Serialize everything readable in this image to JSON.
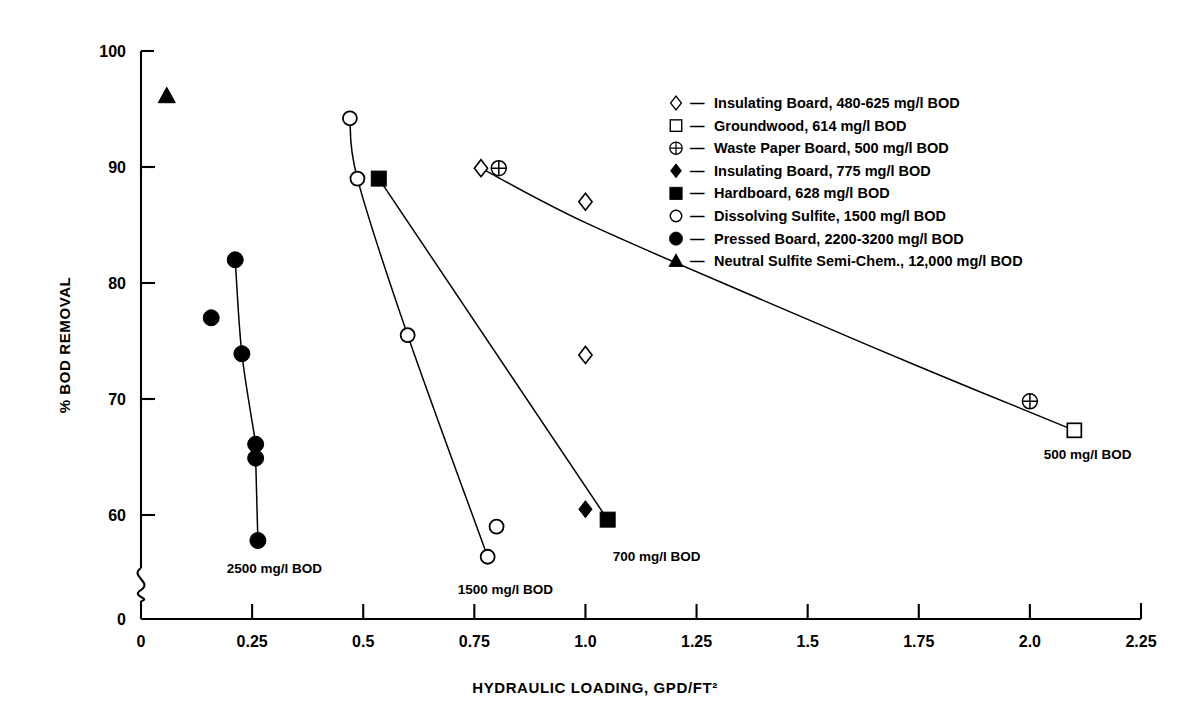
{
  "chart_data": {
    "type": "scatter",
    "title": "",
    "xlabel": "HYDRAULIC LOADING, GPD/FT²",
    "ylabel": "% BOD REMOVAL",
    "xlim": [
      0,
      2.25
    ],
    "ylim": [
      55,
      100
    ],
    "y_axis_break": true,
    "y_break_label": "0",
    "grid": false,
    "legend_position": "upper right",
    "xticks": [
      "0",
      "0.25",
      "0.5",
      "0.75",
      "1.0",
      "1.25",
      "1.5",
      "1.75",
      "2.0",
      "2.25"
    ],
    "xtick_values": [
      0,
      0.25,
      0.5,
      0.75,
      1.0,
      1.25,
      1.5,
      1.75,
      2.0,
      2.25
    ],
    "yticks": [
      "60",
      "70",
      "80",
      "90",
      "100"
    ],
    "ytick_values": [
      60,
      70,
      80,
      90,
      100
    ],
    "series": [
      {
        "name": "Insulating Board, 480-625 mg/l BOD",
        "marker": "open-diamond",
        "points": [
          {
            "x": 0.765,
            "y": 89.9
          },
          {
            "x": 1.0,
            "y": 87.0
          },
          {
            "x": 1.0,
            "y": 73.8
          }
        ]
      },
      {
        "name": "Groundwood, 614 mg/l BOD",
        "marker": "open-square",
        "points": [
          {
            "x": 2.1,
            "y": 67.3
          }
        ]
      },
      {
        "name": "Waste Paper Board, 500 mg/l BOD",
        "marker": "crossed-circle",
        "points": [
          {
            "x": 0.805,
            "y": 89.9
          },
          {
            "x": 2.0,
            "y": 69.8
          }
        ]
      },
      {
        "name": "Insulating Board, 775 mg/l BOD",
        "marker": "filled-diamond",
        "points": [
          {
            "x": 1.0,
            "y": 60.5
          }
        ]
      },
      {
        "name": "Hardboard, 628 mg/l BOD",
        "marker": "filled-square",
        "points": [
          {
            "x": 0.535,
            "y": 89.0
          },
          {
            "x": 1.05,
            "y": 59.6
          }
        ]
      },
      {
        "name": "Dissolving Sulfite, 1500 mg/l BOD",
        "marker": "open-circle",
        "points": [
          {
            "x": 0.47,
            "y": 94.2
          },
          {
            "x": 0.487,
            "y": 89.0
          },
          {
            "x": 0.6,
            "y": 75.5
          },
          {
            "x": 0.8,
            "y": 59.0
          },
          {
            "x": 0.78,
            "y": 56.4
          }
        ]
      },
      {
        "name": "Pressed Board, 2200-3200 mg/l BOD",
        "marker": "filled-circle",
        "points": [
          {
            "x": 0.212,
            "y": 82.0
          },
          {
            "x": 0.158,
            "y": 77.0
          },
          {
            "x": 0.227,
            "y": 73.9
          },
          {
            "x": 0.258,
            "y": 66.1
          },
          {
            "x": 0.258,
            "y": 64.9
          },
          {
            "x": 0.263,
            "y": 57.8
          }
        ]
      },
      {
        "name": "Neutral Sulfite Semi-Chem., 12,000 mg/l BOD",
        "marker": "filled-triangle",
        "points": [
          {
            "x": 0.058,
            "y": 96.1
          }
        ]
      }
    ],
    "curves": [
      {
        "name": "2500 mg/l BOD",
        "label": "2500 mg/l BOD",
        "label_x": 0.3,
        "label_y": 55.0,
        "path": [
          {
            "x": 0.212,
            "y": 82.0
          },
          {
            "x": 0.227,
            "y": 73.9
          },
          {
            "x": 0.258,
            "y": 66.1
          },
          {
            "x": 0.258,
            "y": 64.9
          },
          {
            "x": 0.263,
            "y": 57.8
          }
        ]
      },
      {
        "name": "1500 mg/l BOD",
        "label": "1500 mg/l BOD",
        "label_x": 0.82,
        "label_y": 53.2,
        "path": [
          {
            "x": 0.47,
            "y": 94.2
          },
          {
            "x": 0.487,
            "y": 89.0
          },
          {
            "x": 0.6,
            "y": 75.5
          },
          {
            "x": 0.78,
            "y": 56.4
          }
        ]
      },
      {
        "name": "700 mg/l BOD",
        "label": "700 mg/l BOD",
        "label_x": 1.16,
        "label_y": 56.0,
        "path": [
          {
            "x": 0.535,
            "y": 89.0
          },
          {
            "x": 1.05,
            "y": 59.6
          }
        ]
      },
      {
        "name": "500 mg/l BOD",
        "label": "500 mg/l BOD",
        "label_x": 2.13,
        "label_y": 64.8,
        "path": [
          {
            "x": 0.765,
            "y": 89.9
          },
          {
            "x": 1.0,
            "y": 85.2
          },
          {
            "x": 1.4,
            "y": 78.5
          },
          {
            "x": 1.75,
            "y": 72.8
          },
          {
            "x": 2.1,
            "y": 67.3
          }
        ]
      }
    ],
    "legend": [
      {
        "marker": "open-diamond",
        "dash": "—",
        "label": "Insulating Board, 480-625 mg/l BOD"
      },
      {
        "marker": "open-square",
        "dash": "—",
        "label": "Groundwood, 614 mg/l BOD"
      },
      {
        "marker": "crossed-circle",
        "dash": "—",
        "label": "Waste Paper Board, 500 mg/l BOD"
      },
      {
        "marker": "filled-diamond",
        "dash": "—",
        "label": "Insulating Board, 775 mg/l BOD"
      },
      {
        "marker": "filled-square",
        "dash": "—",
        "label": "Hardboard, 628 mg/l BOD"
      },
      {
        "marker": "open-circle",
        "dash": "—",
        "label": "Dissolving Sulfite, 1500 mg/l BOD"
      },
      {
        "marker": "filled-circle",
        "dash": "—",
        "label": "Pressed Board, 2200-3200 mg/l BOD"
      },
      {
        "marker": "filled-triangle",
        "dash": "—",
        "label": "Neutral Sulfite Semi-Chem., 12,000 mg/l BOD"
      }
    ],
    "colors": {
      "ink": "#000000",
      "background": "#ffffff"
    }
  }
}
